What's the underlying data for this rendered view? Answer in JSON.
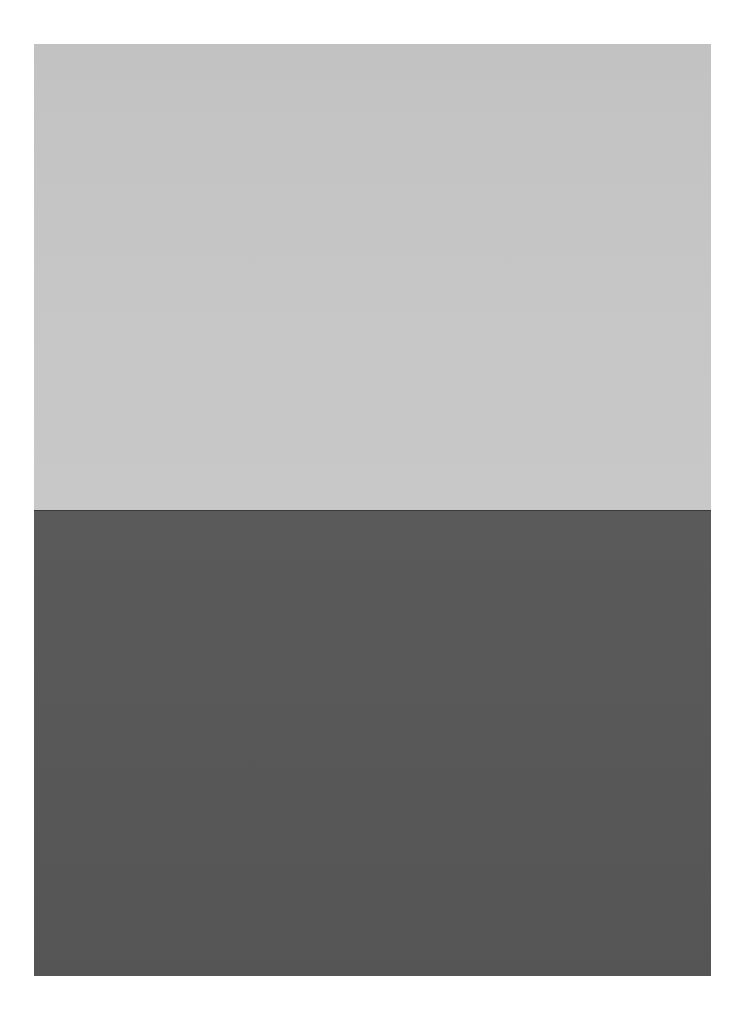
{
  "image": {
    "description": "Minimalist seascape photograph: light gray sky above a sharp horizon line, dark gray sea below, on a white border",
    "colors": {
      "background": "#ffffff",
      "sky": "#c4c4c4",
      "horizon": "#3a3a3a",
      "sea": "#575757"
    }
  }
}
